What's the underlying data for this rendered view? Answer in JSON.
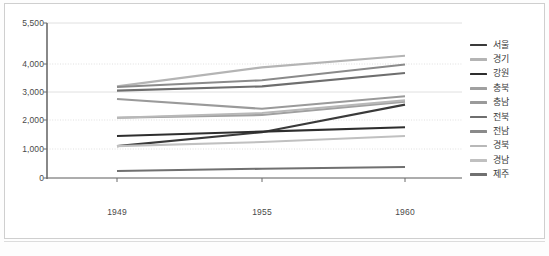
{
  "chart_data": {
    "type": "line",
    "title": "",
    "xlabel": "",
    "ylabel": "",
    "x": [
      "1949",
      "1955",
      "1960"
    ],
    "categories": [
      "1949",
      "1955",
      "1960"
    ],
    "ylim": [
      0,
      5500
    ],
    "ytick_values": [
      0,
      1000,
      2000,
      3000,
      4000,
      5500
    ],
    "ytick_labels": [
      "0",
      "1,000",
      "2,000",
      "3,000",
      "4,000",
      "5,500"
    ],
    "grid": true,
    "legend_position": "right",
    "series": [
      {
        "name": "서울",
        "values": [
          1100,
          1580,
          2550
        ],
        "color": "#3a3a3a"
      },
      {
        "name": "경기",
        "values": [
          3200,
          3880,
          4300
        ],
        "color": "#b4b4b4"
      },
      {
        "name": "강원",
        "values": [
          1450,
          1600,
          1750
        ],
        "color": "#2e2e2e"
      },
      {
        "name": "충북",
        "values": [
          2080,
          2180,
          2650
        ],
        "color": "#a0a0a0"
      },
      {
        "name": "충남",
        "values": [
          2750,
          2400,
          2850
        ],
        "color": "#9a9a9a"
      },
      {
        "name": "전북",
        "values": [
          3050,
          3200,
          3680
        ],
        "color": "#6e6e6e"
      },
      {
        "name": "전남",
        "values": [
          3180,
          3420,
          3980
        ],
        "color": "#8a8a8a"
      },
      {
        "name": "경북",
        "values": [
          2080,
          2250,
          2700
        ],
        "color": "#b8b8b8"
      },
      {
        "name": "경남",
        "values": [
          1100,
          1240,
          1450
        ],
        "color": "#c0c0c0"
      },
      {
        "name": "제주",
        "values": [
          240,
          320,
          380
        ],
        "color": "#707070"
      }
    ],
    "axis_color": "#6b6b6b",
    "grid_color": "#d8d8d8",
    "background": "#ffffff"
  },
  "legend": {
    "items": [
      {
        "label": "서울"
      },
      {
        "label": "경기"
      },
      {
        "label": "강원"
      },
      {
        "label": "충북"
      },
      {
        "label": "충남"
      },
      {
        "label": "전북"
      },
      {
        "label": "전남"
      },
      {
        "label": "경북"
      },
      {
        "label": "경남"
      },
      {
        "label": "제주"
      }
    ]
  }
}
